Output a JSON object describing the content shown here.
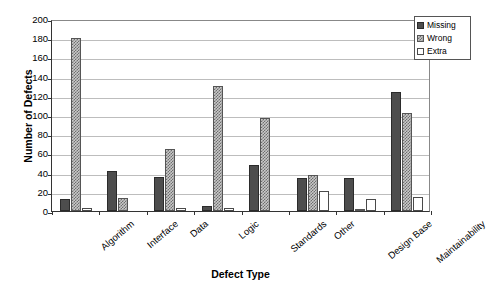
{
  "chart_data": {
    "type": "bar",
    "title": "",
    "xlabel": "Defect Type",
    "ylabel": "Number of Defects",
    "ylim": [
      0,
      200
    ],
    "ytick_step": 20,
    "yticks": [
      200,
      180,
      160,
      140,
      120,
      100,
      80,
      60,
      40,
      20,
      0
    ],
    "grid": true,
    "grid_axis": "y",
    "legend_position": "top-right",
    "categories": [
      "Algorithm",
      "Interface",
      "Data",
      "Logic",
      "Standards",
      "Other",
      "Design Base",
      "Maintainability"
    ],
    "series": [
      {
        "name": "Missing",
        "color": "#4d4d4d",
        "fill": "solid-dark-gray",
        "values": [
          13,
          42,
          35,
          5,
          48,
          34,
          34,
          124
        ]
      },
      {
        "name": "Wrong",
        "color": "#c9c9c9",
        "fill": "checkered-gray",
        "values": [
          180,
          14,
          65,
          130,
          97,
          37,
          1,
          102
        ]
      },
      {
        "name": "Extra",
        "color": "#ffffff",
        "fill": "white-outlined",
        "values": [
          3,
          0,
          3,
          3,
          0,
          21,
          13,
          15
        ]
      }
    ]
  },
  "legend": {
    "items": [
      {
        "label": "Missing",
        "series_class": "series-missing"
      },
      {
        "label": "Wrong",
        "series_class": "series-wrong"
      },
      {
        "label": "Extra",
        "series_class": "series-extra"
      }
    ]
  },
  "axes": {
    "y_title": "Number of Defects",
    "x_title": "Defect Type"
  }
}
